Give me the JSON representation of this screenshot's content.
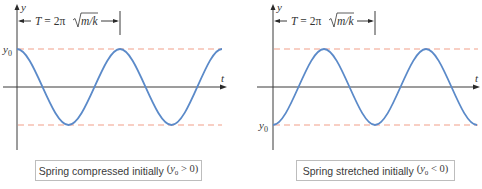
{
  "panels": [
    {
      "id": "compressed",
      "y_axis_label": "y",
      "t_axis_label": "t",
      "y0_label": "y",
      "y0_sub": "0",
      "period_formula": {
        "lhs": "T",
        "eq": " = 2π",
        "radicand": "m/k"
      },
      "caption_text": "Spring compressed initially",
      "caption_math_open": "(",
      "caption_math_var": "y",
      "caption_math_sub": "0",
      "caption_math_rest": " > 0)"
    },
    {
      "id": "stretched",
      "y_axis_label": "y",
      "t_axis_label": "t",
      "y0_label": "y",
      "y0_sub": "0",
      "period_formula": {
        "lhs": "T",
        "eq": " = 2π",
        "radicand": "m/k"
      },
      "caption_text": "Spring stretched initially",
      "caption_math_open": "(",
      "caption_math_var": "y",
      "caption_math_sub": "0",
      "caption_math_rest": " < 0)"
    }
  ],
  "colors": {
    "wave": "#5b8ac9",
    "amplitude_dash": "#f2a08a",
    "axis": "#3a3a3a"
  }
}
